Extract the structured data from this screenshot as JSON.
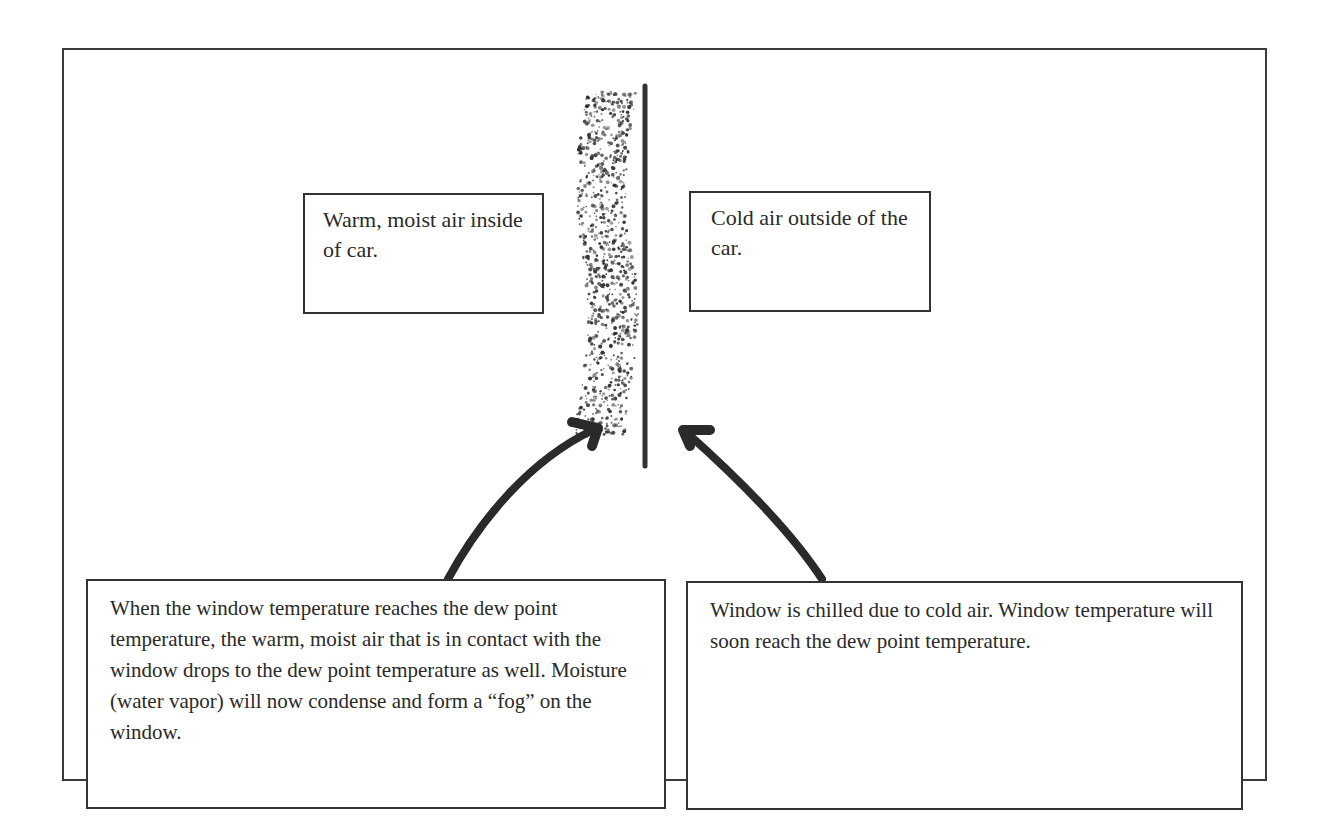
{
  "diagram": {
    "labels": {
      "inside": "Warm, moist air inside of car.",
      "outside": "Cold air outside of the car.",
      "condensation": "When the window temperature reaches the dew point temperature, the warm, moist air that is in contact with the window drops to the dew point temperature as well. Moisture (water vapor) will now condense and form a “fog” on the window.",
      "chill": "Window is chilled due to cold air. Window temperature will soon reach the dew point temperature."
    },
    "elements": {
      "window": "window-pane-line",
      "fog": "condensation-fog-dots",
      "arrows": [
        "arrow-to-fog",
        "arrow-to-window"
      ]
    },
    "colors": {
      "ink": "#2a2a2a",
      "background": "#ffffff"
    }
  }
}
